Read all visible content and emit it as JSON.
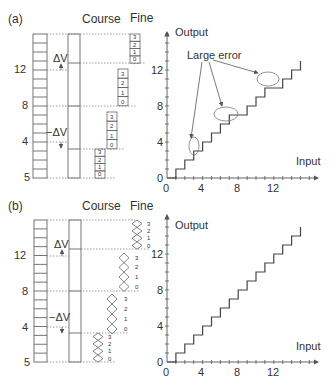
{
  "panel_a": {
    "label": "(a)",
    "course_label": "Course",
    "fine_label": "Fine",
    "delta_v_label": "ΔV",
    "neg_delta_v_label": "−ΔV",
    "left_ticks": [
      "12",
      "8",
      "4",
      "5"
    ],
    "fine_digits": [
      "3",
      "2",
      "1",
      "0"
    ],
    "annotation": "Large error",
    "chart": {
      "ylabel": "Output",
      "xlabel": "Input",
      "yticks": [
        "0",
        "4",
        "8",
        "12"
      ],
      "xticks": [
        "0",
        "4",
        "8",
        "12"
      ]
    }
  },
  "panel_b": {
    "label": "(b)",
    "course_label": "Course",
    "fine_label": "Fine",
    "delta_v_label": "ΔV",
    "neg_delta_v_label": "−ΔV",
    "left_ticks": [
      "12",
      "8",
      "4",
      "5"
    ],
    "fine_digits": [
      "3",
      "2",
      "1",
      "0"
    ],
    "chart": {
      "ylabel": "Output",
      "xlabel": "Input",
      "yticks": [
        "0",
        "4",
        "8",
        "12"
      ],
      "xticks": [
        "0",
        "4",
        "8",
        "12"
      ]
    }
  },
  "chart_data": [
    {
      "type": "line",
      "title": "(a) Staircase transfer with large errors",
      "xlabel": "Input",
      "ylabel": "Output",
      "x": [
        0,
        1,
        1,
        2,
        2,
        3,
        3,
        4,
        4,
        5,
        5,
        6,
        6,
        7,
        7,
        8,
        8,
        9,
        9,
        10,
        10,
        11,
        11,
        12,
        12,
        13,
        13,
        14,
        14,
        15,
        15
      ],
      "y": [
        0,
        0,
        1,
        1,
        2,
        2,
        3,
        3,
        4,
        4,
        5,
        5,
        6,
        6,
        7,
        7,
        7,
        7,
        8,
        8,
        9,
        9,
        10,
        10,
        10,
        10,
        11,
        11,
        12,
        12,
        13
      ],
      "annotations": [
        "Large error"
      ],
      "xlim": [
        0,
        16
      ],
      "ylim": [
        0,
        16
      ]
    },
    {
      "type": "line",
      "title": "(b) Monotonic staircase",
      "xlabel": "Input",
      "ylabel": "Output",
      "x": [
        0,
        1,
        1,
        2,
        2,
        3,
        3,
        4,
        4,
        5,
        5,
        6,
        6,
        7,
        7,
        8,
        8,
        9,
        9,
        10,
        10,
        11,
        11,
        12,
        12,
        13,
        13,
        14,
        14,
        15,
        15
      ],
      "y": [
        0,
        0,
        1,
        1,
        2,
        2,
        3,
        3,
        4,
        4,
        5,
        5,
        6,
        6,
        7,
        7,
        8,
        8,
        9,
        9,
        10,
        10,
        11,
        11,
        12,
        12,
        13,
        13,
        14,
        14,
        15
      ],
      "xlim": [
        0,
        16
      ],
      "ylim": [
        0,
        16
      ]
    }
  ]
}
